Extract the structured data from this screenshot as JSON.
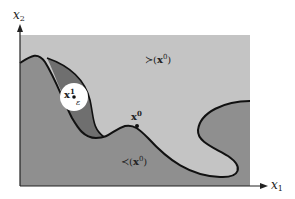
{
  "figure": {
    "axes": {
      "x_label_var": "x",
      "x_label_sub": "1",
      "y_label_var": "x",
      "y_label_sub": "2"
    },
    "regions": {
      "upper": {
        "prefix": "≻(",
        "var": "x",
        "sup": "0",
        "suffix": ")"
      },
      "lower": {
        "prefix": "≺(",
        "var": "x",
        "sup": "0",
        "suffix": ")"
      }
    },
    "points": {
      "x0": {
        "var": "x",
        "sup": "0"
      },
      "x1": {
        "var": "x",
        "sup": "1"
      },
      "epsilon": "ε"
    },
    "colors": {
      "background": "#ffffff",
      "lower_region": "#8f8f8f",
      "upper_region": "#c4c4c4",
      "lens_region": "#6f6f6f",
      "boundary": "#111111",
      "ball": "#ffffff"
    }
  }
}
